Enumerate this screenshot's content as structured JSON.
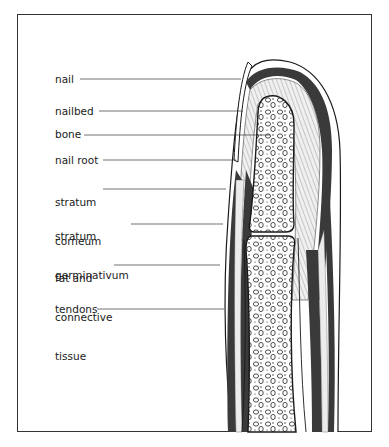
{
  "diagram": {
    "labels": [
      {
        "id": "nail",
        "text": "nail",
        "lines": [
          "nail"
        ]
      },
      {
        "id": "nailbed",
        "text": "nailbed",
        "lines": [
          "nailbed"
        ]
      },
      {
        "id": "bone",
        "text": "bone",
        "lines": [
          "bone"
        ]
      },
      {
        "id": "nail-root",
        "text": "nail root",
        "lines": [
          "nail root"
        ]
      },
      {
        "id": "stratum-corneum",
        "text": "stratum corneum",
        "lines": [
          "stratum",
          "corneum"
        ]
      },
      {
        "id": "stratum-germinativum",
        "text": "stratum germinativum",
        "lines": [
          "stratum",
          "germinativum"
        ]
      },
      {
        "id": "fat-connective-tissue",
        "text": "fat and connective tissue",
        "lines": [
          "fat and",
          "connective",
          "tissue"
        ]
      },
      {
        "id": "tendons",
        "text": "tendons",
        "lines": [
          "tendons"
        ]
      }
    ],
    "colors": {
      "outline": "#1a1a1a",
      "dark_band": "#3a3a3a",
      "light_fill": "#e6e6e6",
      "background": "#ffffff"
    }
  }
}
